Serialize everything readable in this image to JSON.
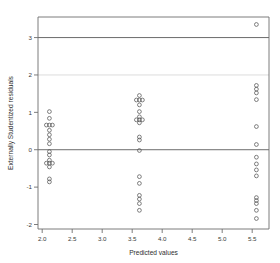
{
  "chart_data": {
    "type": "scatter",
    "title": "",
    "xlabel": "Predicted values",
    "ylabel": "Externally Studentized residuals",
    "xlim": [
      1.93,
      5.78
    ],
    "ylim": [
      -2.12,
      3.55
    ],
    "xticks": [
      2.0,
      2.5,
      3.0,
      3.5,
      4.0,
      4.5,
      5.0,
      5.5
    ],
    "xticklabels": [
      "2.0",
      "2.5",
      "3.0",
      "3.5",
      "4.0",
      "4.5",
      "5.0",
      "5.5"
    ],
    "yticks": [
      -2,
      -1,
      0,
      1,
      2,
      3
    ],
    "yticklabels": [
      "-2",
      "-1",
      "0",
      "1",
      "2",
      "3"
    ],
    "grid": false,
    "marker": "open-circle",
    "marker_color": "#555555",
    "reference_lines": [
      {
        "y": 3,
        "style": "solid",
        "color": "#5a5a5a",
        "weight": "strong"
      },
      {
        "y": 2,
        "style": "solid",
        "color": "#d8d8d8",
        "weight": "faint"
      },
      {
        "y": 0,
        "style": "solid",
        "color": "#5a5a5a",
        "weight": "strong"
      }
    ],
    "legend": null,
    "points": [
      {
        "x": 2.12,
        "y": 1.02
      },
      {
        "x": 2.12,
        "y": 0.84
      },
      {
        "x": 2.12,
        "y": 0.66
      },
      {
        "x": 2.17,
        "y": 0.66
      },
      {
        "x": 2.07,
        "y": 0.66
      },
      {
        "x": 2.12,
        "y": 0.52
      },
      {
        "x": 2.12,
        "y": 0.4
      },
      {
        "x": 2.12,
        "y": 0.28
      },
      {
        "x": 2.12,
        "y": 0.16
      },
      {
        "x": 2.12,
        "y": -0.05
      },
      {
        "x": 2.12,
        "y": -0.14
      },
      {
        "x": 2.12,
        "y": -0.28
      },
      {
        "x": 2.12,
        "y": -0.36
      },
      {
        "x": 2.17,
        "y": -0.36
      },
      {
        "x": 2.07,
        "y": -0.36
      },
      {
        "x": 2.12,
        "y": -0.46
      },
      {
        "x": 2.12,
        "y": -0.78
      },
      {
        "x": 2.12,
        "y": -0.86
      },
      {
        "x": 3.62,
        "y": 1.45
      },
      {
        "x": 3.62,
        "y": 1.33
      },
      {
        "x": 3.67,
        "y": 1.33
      },
      {
        "x": 3.57,
        "y": 1.33
      },
      {
        "x": 3.62,
        "y": 1.2
      },
      {
        "x": 3.62,
        "y": 1.02
      },
      {
        "x": 3.62,
        "y": 0.88
      },
      {
        "x": 3.62,
        "y": 0.8
      },
      {
        "x": 3.62,
        "y": 0.72
      },
      {
        "x": 3.57,
        "y": 0.8
      },
      {
        "x": 3.67,
        "y": 0.8
      },
      {
        "x": 3.62,
        "y": 0.34
      },
      {
        "x": 3.62,
        "y": 0.26
      },
      {
        "x": 3.62,
        "y": -0.02
      },
      {
        "x": 3.62,
        "y": -0.72
      },
      {
        "x": 3.62,
        "y": -0.9
      },
      {
        "x": 3.62,
        "y": -1.22
      },
      {
        "x": 3.62,
        "y": -1.32
      },
      {
        "x": 3.62,
        "y": -1.44
      },
      {
        "x": 3.62,
        "y": -1.62
      },
      {
        "x": 5.57,
        "y": 3.35
      },
      {
        "x": 5.57,
        "y": 1.72
      },
      {
        "x": 5.57,
        "y": 1.62
      },
      {
        "x": 5.57,
        "y": 1.52
      },
      {
        "x": 5.57,
        "y": 1.34
      },
      {
        "x": 5.57,
        "y": 0.62
      },
      {
        "x": 5.57,
        "y": 0.14
      },
      {
        "x": 5.57,
        "y": -0.2
      },
      {
        "x": 5.57,
        "y": -0.38
      },
      {
        "x": 5.57,
        "y": -0.54
      },
      {
        "x": 5.57,
        "y": -0.7
      },
      {
        "x": 5.57,
        "y": -1.28
      },
      {
        "x": 5.57,
        "y": -1.36
      },
      {
        "x": 5.57,
        "y": -1.44
      },
      {
        "x": 5.57,
        "y": -1.62
      },
      {
        "x": 5.57,
        "y": -1.84
      }
    ]
  }
}
